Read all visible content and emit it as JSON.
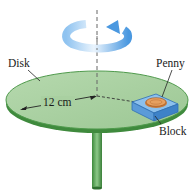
{
  "labels": {
    "disk": "Disk",
    "penny": "Penny",
    "block": "Block",
    "radius": "12 cm"
  },
  "colors": {
    "disk_top": "#a8d0a0",
    "disk_rim": "#4f9a4c",
    "disk_edge": "#2f6f30",
    "shaft": "#4e9a4a",
    "block": "#5b9bd8",
    "block_dark": "#2f6fb4",
    "penny": "#d88a4a",
    "rotation_arrow": "#5aa6e6",
    "axis": "#555555"
  },
  "icons": {
    "rotation": "rotation-arrow-icon"
  }
}
